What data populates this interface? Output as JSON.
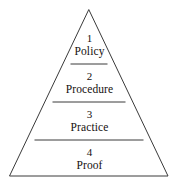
{
  "figure": {
    "type": "pyramid-diagram",
    "title": "",
    "background_color": "#ffffff",
    "line_color": "#3a3a3a",
    "text_color": "#15100e",
    "tier_count": 4
  },
  "tiers": [
    {
      "number": "1",
      "name": "Policy"
    },
    {
      "number": "2",
      "name": "Procedure"
    },
    {
      "number": "3",
      "name": "Practice"
    },
    {
      "number": "4",
      "name": "Proof"
    }
  ]
}
